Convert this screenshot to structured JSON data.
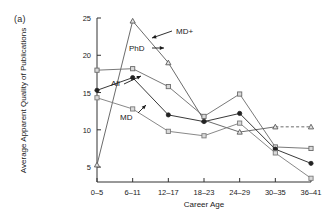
{
  "panel": {
    "label": "(a)"
  },
  "chart_data": {
    "type": "line",
    "title": "",
    "xlabel": "Career Age",
    "ylabel": "Average Apparent Quality of  Publications",
    "categories": [
      "0–5",
      "6–11",
      "12–17",
      "18–23",
      "24–29",
      "30–35",
      "36–41"
    ],
    "ylim": [
      3,
      25
    ],
    "yticks": [
      5,
      10,
      15,
      20,
      25
    ],
    "ytick_labels": [
      "5",
      "10",
      "15",
      "20",
      "25"
    ],
    "grid": false,
    "legend": "inline-annotations",
    "series": [
      {
        "name": "MD+",
        "marker": "triangle-open",
        "color": "#5a5a5a",
        "values": [
          5.3,
          24.6,
          19.0,
          11.3,
          9.7,
          10.4,
          10.4
        ],
        "dashed_from_index": 5,
        "annotation": {
          "text": "MD+",
          "arrow": "left"
        }
      },
      {
        "name": "PhD",
        "marker": "square-open",
        "color": "#6a6a6a",
        "values": [
          18.0,
          18.2,
          15.8,
          11.8,
          14.8,
          7.7,
          7.5
        ],
        "annotation": {
          "text": "PhD",
          "arrow": "right"
        }
      },
      {
        "name": "All",
        "marker": "circle-filled",
        "color": "#222222",
        "values": [
          15.3,
          17.0,
          12.0,
          11.1,
          12.2,
          7.4,
          5.5
        ],
        "annotation": {
          "text": "All",
          "arrow": "right"
        }
      },
      {
        "name": "MD",
        "marker": "square-open",
        "color": "#7a7a7a",
        "values": [
          14.3,
          12.8,
          9.8,
          9.2,
          10.9,
          6.9,
          3.5
        ],
        "annotation": {
          "text": "MD",
          "arrow": "right"
        }
      }
    ]
  }
}
